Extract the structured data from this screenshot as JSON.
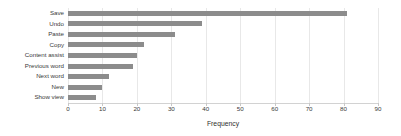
{
  "chart_data": {
    "type": "bar",
    "orientation": "horizontal",
    "title": "",
    "subtitle": "",
    "xlabel": "Frequency",
    "ylabel": "",
    "categories": [
      "Save",
      "Undo",
      "Paste",
      "Copy",
      "Content assist",
      "Previous word",
      "Next word",
      "New",
      "Show view"
    ],
    "values": [
      81,
      39,
      31,
      22,
      20,
      19,
      12,
      10,
      8
    ],
    "xlim": [
      0,
      90
    ],
    "xticks": [
      0,
      10,
      20,
      30,
      40,
      50,
      60,
      70,
      80,
      90
    ],
    "xticklabels": [
      "0",
      "10",
      "20",
      "30",
      "40",
      "50",
      "60",
      "70",
      "80",
      "90"
    ],
    "grid": true,
    "grid_axis": "x",
    "legend": false,
    "bar_color": "#8c8c8c",
    "background_color": "#ffffff",
    "gridline_color": "#e8e8e8",
    "text_color": "#3a3a3a"
  }
}
